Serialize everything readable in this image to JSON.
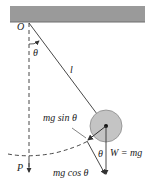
{
  "diagram": {
    "type": "simple-pendulum-free-body",
    "labels": {
      "pivot": "O",
      "angle_top": "θ",
      "length": "l",
      "tangential": "mg sin θ",
      "angle_bottom": "θ",
      "weight": "W = mg",
      "radial": "mg cos θ",
      "equilibrium": "P"
    },
    "colors": {
      "ceiling": "#9a9a9a",
      "ceiling_edge": "#6e6e6e",
      "bob": "#c4c4c4",
      "bob_edge": "#8a8a8a",
      "line": "#333333"
    }
  }
}
